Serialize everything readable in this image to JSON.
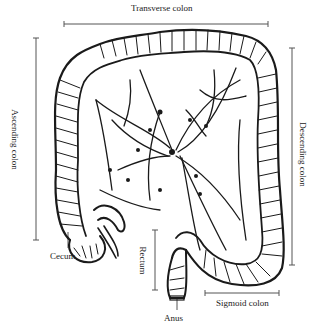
{
  "diagram": {
    "type": "anatomical line drawing",
    "labels": {
      "transverse": "Transverse colon",
      "ascending": "Ascending colon",
      "descending": "Descending colon",
      "cecum": "Cecum",
      "rectum": "Rectum",
      "anus": "Anus",
      "sigmoid": "Sigmoid colon"
    },
    "colors": {
      "ink": "#1a1a1a",
      "bracket": "#555555",
      "background": "#ffffff"
    }
  }
}
